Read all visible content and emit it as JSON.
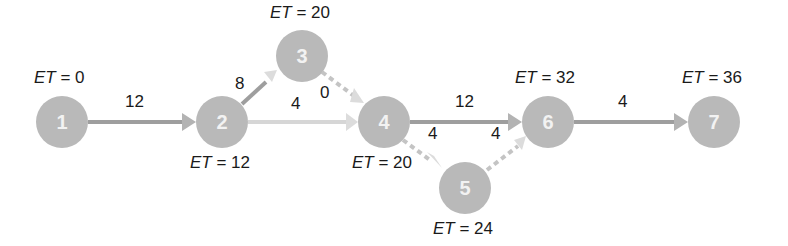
{
  "diagram": {
    "type": "activity-on-arrow network",
    "nodes": [
      {
        "id": "1",
        "label": "1",
        "et_prefix": "ET",
        "et_value": "= 0"
      },
      {
        "id": "2",
        "label": "2",
        "et_prefix": "ET",
        "et_value": "= 12"
      },
      {
        "id": "3",
        "label": "3",
        "et_prefix": "ET",
        "et_value": "= 20"
      },
      {
        "id": "4",
        "label": "4",
        "et_prefix": "ET",
        "et_value": "= 20"
      },
      {
        "id": "5",
        "label": "5",
        "et_prefix": "ET",
        "et_value": "= 24"
      },
      {
        "id": "6",
        "label": "6",
        "et_prefix": "ET",
        "et_value": "= 32"
      },
      {
        "id": "7",
        "label": "7",
        "et_prefix": "ET",
        "et_value": "= 36"
      }
    ],
    "edges": [
      {
        "from": "1",
        "to": "2",
        "duration": "12"
      },
      {
        "from": "2",
        "to": "3",
        "duration": "8"
      },
      {
        "from": "2",
        "to": "4",
        "duration": "4"
      },
      {
        "from": "3",
        "to": "4",
        "duration": "0"
      },
      {
        "from": "4",
        "to": "6",
        "duration": "12"
      },
      {
        "from": "4",
        "to": "5",
        "duration": "4"
      },
      {
        "from": "5",
        "to": "6",
        "duration": "4"
      },
      {
        "from": "6",
        "to": "7",
        "duration": "4"
      }
    ]
  }
}
